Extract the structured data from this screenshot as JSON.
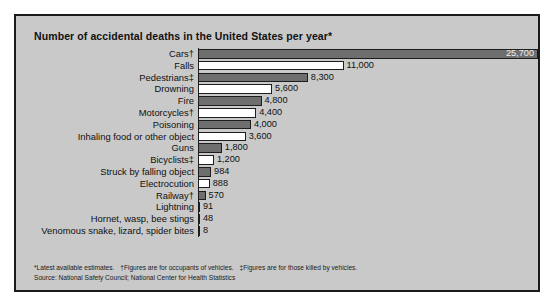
{
  "chart_data": {
    "type": "bar",
    "orientation": "horizontal",
    "title": "Number of accidental deaths in the United States per year*",
    "xlabel": "",
    "ylabel": "",
    "xlim": [
      0,
      25700
    ],
    "grid": false,
    "legend": null,
    "categories": [
      "Cars†",
      "Falls",
      "Pedestrians‡",
      "Drowning",
      "Fire",
      "Motorcycles†",
      "Poisoning",
      "Inhaling food or other object",
      "Guns",
      "Bicyclists‡",
      "Struck by falling object",
      "Electrocution",
      "Railway†",
      "Lightning",
      "Hornet, wasp, bee stings",
      "Venomous snake, lizard, spider bites"
    ],
    "values": [
      25700,
      11000,
      8300,
      5600,
      4800,
      4400,
      4000,
      3600,
      1800,
      1200,
      984,
      888,
      570,
      91,
      48,
      8
    ],
    "value_labels": [
      "25,700",
      "11,000",
      "8,300",
      "5,600",
      "4,800",
      "4,400",
      "4,000",
      "3,600",
      "1,800",
      "1,200",
      "984",
      "888",
      "570",
      "91",
      "48",
      "8"
    ],
    "bar_fills": [
      "dark",
      "light",
      "dark",
      "light",
      "dark",
      "light",
      "dark",
      "light",
      "dark",
      "light",
      "dark",
      "light",
      "dark",
      "light",
      "dark",
      "light"
    ],
    "label_placement": [
      "inside",
      "outside",
      "outside",
      "outside",
      "outside",
      "outside",
      "outside",
      "outside",
      "outside",
      "outside",
      "outside",
      "outside",
      "outside",
      "outside",
      "outside",
      "outside"
    ],
    "colors": {
      "bar_dark": "#6e6e6e",
      "bar_light": "#ffffff",
      "bar_outline": "#1d1d1d",
      "panel_background": "#c9c9c9",
      "panel_border": "#1b1b1b",
      "text": "#101010",
      "page_background": "#ffffff"
    }
  },
  "footnotes": {
    "line1_a": "*Latest available estimates.",
    "line1_b": "†Figures are for occupants of vehicles.",
    "line1_c": "‡Figures are for those killed by vehicles.",
    "line2": "Source: National Safety Council; National Center for Health Statistics"
  }
}
